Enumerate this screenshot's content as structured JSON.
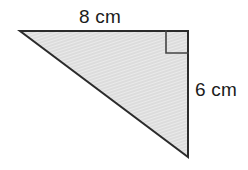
{
  "figure": {
    "type": "right-triangle-diagram",
    "canvas": {
      "width": 248,
      "height": 170,
      "background": "#ffffff"
    },
    "shape": {
      "name": "right triangle",
      "vertices": [
        {
          "id": "left-apex",
          "x": 20,
          "y": 31
        },
        {
          "id": "top-right",
          "x": 188,
          "y": 31
        },
        {
          "id": "bottom-right",
          "x": 188,
          "y": 157
        }
      ],
      "fill_color": "#dcdcdc",
      "hatch_color": "#ffffff",
      "stroke_color": "#2b2b2b",
      "stroke_width": 2
    },
    "right_angle_marker": {
      "present": true,
      "x": 166,
      "y": 31,
      "size": 22,
      "stroke_color": "#444444",
      "stroke_width": 1.6,
      "fill": "none"
    },
    "labels": {
      "top_side": {
        "text": "8 cm",
        "value": 8,
        "unit": "cm",
        "side": "top",
        "color": "#1c1c1c"
      },
      "right_side": {
        "text": "6 cm",
        "value": 6,
        "unit": "cm",
        "side": "right",
        "color": "#1c1c1c"
      }
    }
  }
}
